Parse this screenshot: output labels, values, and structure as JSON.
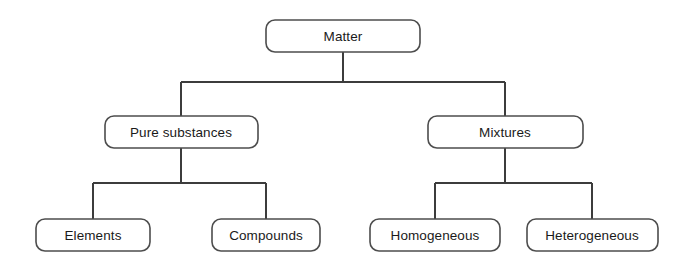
{
  "diagram": {
    "type": "hierarchy-tree",
    "background_color": "#ffffff",
    "box_stroke_color": "#4d4d4d",
    "connector_color": "#3c3c3c",
    "text_color": "#1a1a1a",
    "levels": 3,
    "nodes": {
      "root": {
        "label": "Matter",
        "level": 0,
        "x": 266,
        "y": 20,
        "width": 154,
        "height": 32,
        "center_x": 343,
        "center_y": 36
      },
      "pure_substances": {
        "label": "Pure substances",
        "level": 1,
        "x": 105,
        "y": 116,
        "width": 153,
        "height": 32,
        "center_x": 181,
        "center_y": 132
      },
      "mixtures": {
        "label": "Mixtures",
        "level": 1,
        "x": 428,
        "y": 116,
        "width": 155,
        "height": 32,
        "center_x": 505,
        "center_y": 132
      },
      "elements": {
        "label": "Elements",
        "level": 2,
        "x": 36,
        "y": 219,
        "width": 114,
        "height": 32,
        "center_x": 93,
        "center_y": 235
      },
      "compounds": {
        "label": "Compounds",
        "level": 2,
        "x": 212,
        "y": 219,
        "width": 108,
        "height": 32,
        "center_x": 266,
        "center_y": 235
      },
      "homogeneous": {
        "label": "Homogeneous",
        "level": 2,
        "x": 370,
        "y": 219,
        "width": 130,
        "height": 32,
        "center_x": 435,
        "center_y": 235
      },
      "heterogeneous": {
        "label": "Heterogeneous",
        "level": 2,
        "x": 527,
        "y": 219,
        "width": 131,
        "height": 32,
        "center_x": 592,
        "center_y": 235
      }
    },
    "edges": [
      {
        "from": "root",
        "to": "pure_substances"
      },
      {
        "from": "root",
        "to": "mixtures"
      },
      {
        "from": "pure_substances",
        "to": "elements"
      },
      {
        "from": "pure_substances",
        "to": "compounds"
      },
      {
        "from": "mixtures",
        "to": "homogeneous"
      },
      {
        "from": "mixtures",
        "to": "heterogeneous"
      }
    ],
    "connector_paths": {
      "root_stem": "M 343 52 L 343 82",
      "root_bus": "M 181 82 L 505 82",
      "pure_substances_drop": "M 181 82 L 181 116",
      "mixtures_drop": "M 505 82 L 505 116",
      "pure_substances_stem": "M 181 148 L 181 183",
      "pure_substances_bus": "M 93 183 L 266 183",
      "elements_drop": "M 93 183 L 93 219",
      "compounds_drop": "M 266 183 L 266 219",
      "mixtures_stem": "M 505 148 L 505 183",
      "mixtures_bus": "M 435 183 L 592 183",
      "homogeneous_drop": "M 435 183 L 435 219",
      "heterogeneous_drop": "M 592 183 L 592 219"
    }
  },
  "chart_data": {
    "type": "table",
    "categories": [
      "Matter",
      "Pure substances",
      "Mixtures",
      "Elements",
      "Compounds",
      "Homogeneous",
      "Heterogeneous"
    ],
    "relations": [
      {
        "parent": "Matter",
        "child": "Pure substances"
      },
      {
        "parent": "Matter",
        "child": "Mixtures"
      },
      {
        "parent": "Pure substances",
        "child": "Elements"
      },
      {
        "parent": "Pure substances",
        "child": "Compounds"
      },
      {
        "parent": "Mixtures",
        "child": "Homogeneous"
      },
      {
        "parent": "Mixtures",
        "child": "Heterogeneous"
      }
    ]
  }
}
